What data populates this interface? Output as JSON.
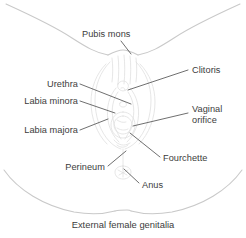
{
  "figure": {
    "caption": "External female genitalia",
    "colors": {
      "body_outline": "#c9c9c9",
      "anatomy_sketch": "#dcdcdc",
      "leader_line": "#4a4a4a",
      "text": "#3c3c3c",
      "background": "#ffffff"
    }
  },
  "labels": [
    {
      "id": "pubis-mons",
      "text": "Pubis mons",
      "align": "left",
      "x": 82,
      "y": 29
    },
    {
      "id": "clitoris",
      "text": "Clitoris",
      "align": "left",
      "x": 192,
      "y": 65
    },
    {
      "id": "urethra",
      "text": "Urethra",
      "align": "right",
      "x": 8,
      "y": 79,
      "w": 70
    },
    {
      "id": "labia-minora",
      "text": "Labia minora",
      "align": "right",
      "x": 8,
      "y": 96,
      "w": 70
    },
    {
      "id": "vaginal-orifice",
      "text": "Vaginal orifice",
      "align": "left",
      "x": 192,
      "y": 104
    },
    {
      "id": "labia-majora",
      "text": "Labia majora",
      "align": "right",
      "x": 8,
      "y": 125,
      "w": 70
    },
    {
      "id": "fourchette",
      "text": "Fourchette",
      "align": "left",
      "x": 163,
      "y": 153
    },
    {
      "id": "perineum",
      "text": "Perineum",
      "align": "right",
      "x": 35,
      "y": 162,
      "w": 70
    },
    {
      "id": "anus",
      "text": "Anus",
      "align": "left",
      "x": 142,
      "y": 180
    }
  ],
  "leader_lines": [
    {
      "id": "pubis-mons",
      "points": "121,41 131,54"
    },
    {
      "id": "clitoris",
      "points": "188,70 128,90"
    },
    {
      "id": "urethra",
      "points": "80,84 131,104"
    },
    {
      "id": "labia-minora",
      "points": "80,101 115,113"
    },
    {
      "id": "vaginal-orifice",
      "points": "188,113 133,126"
    },
    {
      "id": "labia-majora",
      "points": "80,130 108,119"
    },
    {
      "id": "fourchette",
      "points": "160,157 130,133"
    },
    {
      "id": "perineum",
      "points": "108,166 126,151"
    },
    {
      "id": "anus",
      "points": "139,183 124,169"
    }
  ]
}
